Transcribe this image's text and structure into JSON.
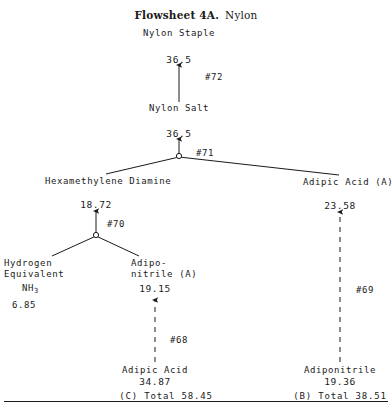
{
  "figure": {
    "title_label": "Flowsheet 4A.",
    "title_subject": "Nylon"
  },
  "nodes": {
    "nylon_staple": {
      "label": "Nylon Staple"
    },
    "nylon_salt": {
      "label": "Nylon Salt"
    },
    "hmd": {
      "label": "Hexamethylene Diamine"
    },
    "adipic_acid_a": {
      "label": "Adipic Acid (A)"
    },
    "hydrogen_equiv": {
      "line1": "Hydrogen",
      "line2": "Equivalent",
      "formula": "NH",
      "formula_sub": "3"
    },
    "adiponitrile_a": {
      "line1": "Adipo-",
      "line2": "nitrile (A)"
    },
    "adipic_acid_in": {
      "label": "Adipic Acid"
    },
    "adiponitrile_in": {
      "label": "Adiponitrile"
    }
  },
  "values": {
    "nylon_staple_in": "36.5",
    "nylon_salt_in": "36.5",
    "hmd_in": "18.72",
    "adipic_acid_a_in": "23.58",
    "hydrogen_equiv_amt": "6.85",
    "adiponitrile_a_in": "19.15",
    "adipic_acid_in_amt": "34.87",
    "adiponitrile_in_amt": "19.36"
  },
  "streams": {
    "s72": "#72",
    "s71": "#71",
    "s70": "#70",
    "s69": "#69",
    "s68": "#68"
  },
  "totals": {
    "c_total": "(C) Total  58.45",
    "b_total": "(B) Total  38.51"
  },
  "colors": {
    "ink": "#1a1a1a",
    "paper": "#ffffff"
  }
}
